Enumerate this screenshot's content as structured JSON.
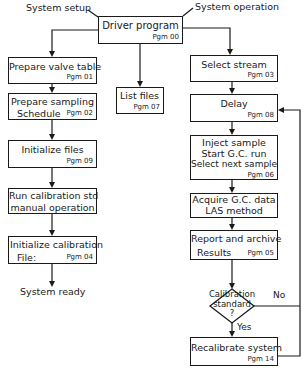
{
  "diagram": {
    "type": "flowchart",
    "annotations": {
      "system_setup": "System setup",
      "system_operation": "System operation",
      "system_ready": "System ready"
    },
    "driver": {
      "title": "Driver program",
      "pgm": "Pgm 00"
    },
    "setup_branch": [
      {
        "line1": "Prepare valve table",
        "line2": "",
        "pgm": "Pgm 01"
      },
      {
        "line1": "Prepare sampling",
        "line2": "Schedule",
        "pgm": "Pgm 02"
      },
      {
        "line1": "Initialize files",
        "line2": "",
        "pgm": "Pgm 09"
      },
      {
        "line1": "Run calibration std",
        "line2": "manual operation",
        "pgm": ""
      },
      {
        "line1": "Initialize calibration",
        "line2": "File:",
        "pgm": "Pgm 04"
      }
    ],
    "middle_branch": [
      {
        "line1": "List files",
        "pgm": "Pgm 07"
      }
    ],
    "operation_branch": [
      {
        "line1": "Select stream",
        "pgm": "Pgm 03"
      },
      {
        "line1": "Delay",
        "pgm": "Pgm 08"
      },
      {
        "line1": "Inject sample",
        "line2": "Start G.C. run",
        "line3": "Select next sample",
        "pgm": "Pgm 06"
      },
      {
        "line1": "Acquire  G.C. data",
        "line2": "LAS method",
        "pgm": ""
      },
      {
        "line1": "Report and archive",
        "line2": "Results",
        "pgm": "Pgm 05"
      }
    ],
    "decision": {
      "line1": "Calibration",
      "line2": "standard",
      "line3": "?",
      "yes": "Yes",
      "no": "No"
    },
    "recalibrate": {
      "line1": "Recalibrate system",
      "pgm": "Pgm 14"
    }
  }
}
